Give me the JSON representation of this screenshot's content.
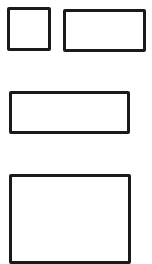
{
  "diagram": {
    "stroke_color": "#1a1a1a",
    "background_color": "#ffffff",
    "shapes": [
      {
        "id": "box-1",
        "kind": "rectangle",
        "label": ""
      },
      {
        "id": "box-2",
        "kind": "rectangle",
        "label": ""
      },
      {
        "id": "box-3",
        "kind": "rectangle",
        "label": ""
      },
      {
        "id": "box-4",
        "kind": "rectangle",
        "label": ""
      }
    ]
  }
}
